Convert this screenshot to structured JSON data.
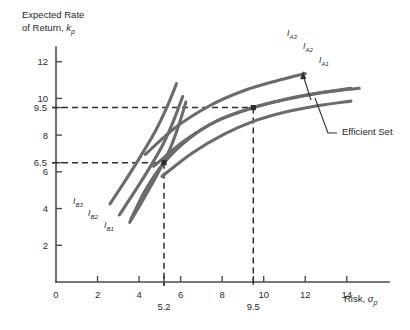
{
  "chart_data": {
    "type": "line",
    "title": "",
    "ylabel": "Expected Rate of Return, k",
    "ylabel_sub": "p",
    "xlabel": "Risk, σ",
    "xlabel_sub": "p",
    "xlim": [
      0,
      15.6
    ],
    "ylim": [
      0,
      12.8
    ],
    "grid": false,
    "legend_position": "inline-curve-labels",
    "x_ticks": [
      {
        "value": 0,
        "label": "0"
      },
      {
        "value": 2,
        "label": "2"
      },
      {
        "value": 4,
        "label": "4"
      },
      {
        "value": 6,
        "label": "6"
      },
      {
        "value": 8,
        "label": "8"
      },
      {
        "value": 10,
        "label": "10"
      },
      {
        "value": 12,
        "label": "12"
      },
      {
        "value": 14,
        "label": "14"
      }
    ],
    "x_special_ticks": [
      {
        "value": 5.2,
        "label": "5.2"
      },
      {
        "value": 9.5,
        "label": "9.5"
      }
    ],
    "y_ticks": [
      {
        "value": 2,
        "label": "2"
      },
      {
        "value": 4,
        "label": "4"
      },
      {
        "value": 6,
        "label": "6"
      },
      {
        "value": 8,
        "label": "8"
      },
      {
        "value": 10,
        "label": "10"
      },
      {
        "value": 12,
        "label": "12"
      }
    ],
    "y_special_ticks": [
      {
        "value": 6.5,
        "label": "6.5"
      },
      {
        "value": 9.5,
        "label": "9.5"
      }
    ],
    "tangency_points": [
      {
        "name": "investor-b-optimal",
        "x": 5.2,
        "y": 6.5
      },
      {
        "name": "investor-a-optimal",
        "x": 9.5,
        "y": 9.5
      }
    ],
    "series": [
      {
        "name": "Efficient Set",
        "role": "efficient-frontier",
        "points": [
          [
            3.6,
            3.4
          ],
          [
            4.3,
            5.0
          ],
          [
            5.2,
            6.5
          ],
          [
            6.4,
            7.8
          ],
          [
            7.8,
            8.8
          ],
          [
            9.5,
            9.5
          ],
          [
            11.2,
            10.0
          ],
          [
            13.0,
            10.35
          ],
          [
            14.6,
            10.55
          ]
        ]
      },
      {
        "name": "IB1",
        "role": "indifference-curve-b",
        "points": [
          [
            3.55,
            3.25
          ],
          [
            4.2,
            4.5
          ],
          [
            4.85,
            5.8
          ],
          [
            5.45,
            7.15
          ],
          [
            5.9,
            8.5
          ],
          [
            6.25,
            9.8
          ]
        ]
      },
      {
        "name": "IB2",
        "role": "indifference-curve-b",
        "points": [
          [
            3.05,
            3.65
          ],
          [
            3.8,
            4.95
          ],
          [
            4.55,
            6.3
          ],
          [
            5.2,
            7.6
          ],
          [
            5.7,
            8.9
          ],
          [
            6.1,
            10.1
          ]
        ]
      },
      {
        "name": "IB3",
        "role": "indifference-curve-b",
        "points": [
          [
            2.6,
            4.25
          ],
          [
            3.35,
            5.55
          ],
          [
            4.1,
            6.9
          ],
          [
            4.8,
            8.25
          ],
          [
            5.35,
            9.55
          ],
          [
            5.8,
            10.8
          ]
        ]
      },
      {
        "name": "IA1",
        "role": "indifference-curve-a",
        "points": [
          [
            5.1,
            5.75
          ],
          [
            6.6,
            7.05
          ],
          [
            8.1,
            8.05
          ],
          [
            9.5,
            8.75
          ],
          [
            11.0,
            9.25
          ],
          [
            12.6,
            9.6
          ],
          [
            14.2,
            9.85
          ]
        ]
      },
      {
        "name": "IA2",
        "role": "indifference-curve-a",
        "points": [
          [
            4.7,
            6.3
          ],
          [
            6.2,
            7.7
          ],
          [
            7.8,
            8.8
          ],
          [
            9.5,
            9.5
          ],
          [
            11.1,
            9.95
          ],
          [
            12.7,
            10.3
          ],
          [
            14.2,
            10.55
          ]
        ]
      },
      {
        "name": "IA3",
        "role": "indifference-curve-a",
        "points": [
          [
            4.3,
            6.95
          ],
          [
            5.8,
            8.45
          ],
          [
            7.4,
            9.6
          ],
          [
            9.0,
            10.4
          ],
          [
            10.6,
            10.95
          ],
          [
            12.0,
            11.35
          ]
        ]
      }
    ],
    "curve_labels": [
      {
        "name": "IB1",
        "base": "I",
        "sub": "B1",
        "x": 104,
        "y": 228
      },
      {
        "name": "IB2",
        "base": "I",
        "sub": "B2",
        "x": 88,
        "y": 216
      },
      {
        "name": "IB3",
        "base": "I",
        "sub": "B3",
        "x": 73,
        "y": 204
      },
      {
        "name": "IA1",
        "base": "I",
        "sub": "A1",
        "x": 319,
        "y": 63
      },
      {
        "name": "IA2",
        "base": "I",
        "sub": "A2",
        "x": 303,
        "y": 49
      },
      {
        "name": "IA3",
        "base": "I",
        "sub": "A3",
        "x": 287,
        "y": 36
      }
    ],
    "annotations": [
      {
        "name": "efficient-set",
        "label": "Efficient Set",
        "x": 340,
        "y": 131
      }
    ]
  }
}
